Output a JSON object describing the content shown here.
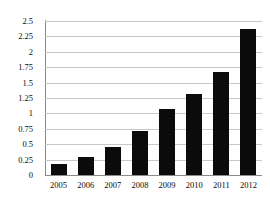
{
  "chart_data": {
    "type": "bar",
    "title": "",
    "xlabel": "",
    "ylabel": "",
    "categories": [
      "2005",
      "2006",
      "2007",
      "2008",
      "2009",
      "2010",
      "2011",
      "2012"
    ],
    "values": [
      0.18,
      0.3,
      0.45,
      0.72,
      1.07,
      1.32,
      1.68,
      2.37
    ],
    "ylim": [
      0,
      2.5
    ],
    "ytick_values": [
      0,
      0.25,
      0.5,
      0.75,
      1,
      1.25,
      1.5,
      1.75,
      2,
      2.25,
      2.5
    ],
    "ytick_labels": [
      "0",
      "0.25",
      "0.5",
      "0.75",
      "1",
      "1.25",
      "1.5",
      "1.75",
      "2",
      "2.25",
      "2.5"
    ],
    "grid": true,
    "legend": "none",
    "series": [
      {
        "name": "Series 1",
        "values": [
          0.18,
          0.3,
          0.45,
          0.72,
          1.07,
          1.32,
          1.68,
          2.37
        ]
      }
    ],
    "colors": {
      "bar": "#0b0b0b",
      "gridline": "#c8c8c8",
      "axis": "#8a8a8a",
      "background": "#ffffff",
      "text": "#0c0c0c"
    }
  }
}
